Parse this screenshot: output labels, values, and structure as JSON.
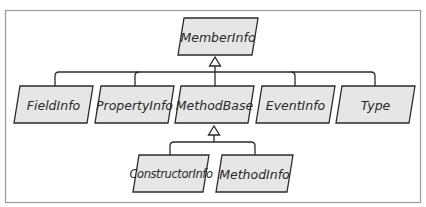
{
  "diagram": {
    "type": "class-hierarchy",
    "nodes": {
      "root": {
        "label": "MemberInfo"
      },
      "field_info": {
        "label": "FieldInfo"
      },
      "property_info": {
        "label": "PropertyInfo"
      },
      "method_base": {
        "label": "MethodBase"
      },
      "event_info": {
        "label": "EventInfo"
      },
      "type": {
        "label": "Type"
      },
      "constructor_info": {
        "label": "ConstructorInfo"
      },
      "method_info": {
        "label": "MethodInfo"
      }
    },
    "edges": [
      {
        "from": "FieldInfo",
        "to": "MemberInfo",
        "kind": "inherits"
      },
      {
        "from": "PropertyInfo",
        "to": "MemberInfo",
        "kind": "inherits"
      },
      {
        "from": "MethodBase",
        "to": "MemberInfo",
        "kind": "inherits"
      },
      {
        "from": "EventInfo",
        "to": "MemberInfo",
        "kind": "inherits"
      },
      {
        "from": "Type",
        "to": "MemberInfo",
        "kind": "inherits"
      },
      {
        "from": "ConstructorInfo",
        "to": "MethodBase",
        "kind": "inherits"
      },
      {
        "from": "MethodInfo",
        "to": "MethodBase",
        "kind": "inherits"
      }
    ],
    "colors": {
      "box_fill": "#e6e6e6",
      "stroke": "#2b2b2b",
      "frame": "#9a9a9a",
      "text": "#2a2a2a"
    }
  }
}
